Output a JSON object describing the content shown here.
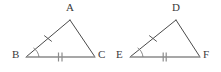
{
  "figure": {
    "background_color": "#ffffff",
    "stroke_color": "#4a4a4a",
    "base_stroke_color": "#8a8a8a",
    "label_color": "#3a3a3a",
    "triangles": [
      {
        "name": "triangle-abc",
        "vertices": [
          {
            "label": "A",
            "x": 70,
            "y": 20,
            "label_x": 66,
            "label_y": 2
          },
          {
            "label": "B",
            "x": 26,
            "y": 57,
            "label_x": 12,
            "label_y": 49
          },
          {
            "label": "C",
            "x": 95,
            "y": 57,
            "label_x": 98,
            "label_y": 49
          }
        ],
        "sides": [
          {
            "name": "side-ab",
            "from": "A",
            "to": "B",
            "ticks": 1
          },
          {
            "name": "side-ac",
            "from": "A",
            "to": "C",
            "ticks": 0
          },
          {
            "name": "side-bc",
            "from": "B",
            "to": "C",
            "ticks": 2
          }
        ],
        "angle_marks": [
          {
            "name": "angle-b",
            "at": "B",
            "arcs": 1
          }
        ]
      },
      {
        "name": "triangle-def",
        "vertices": [
          {
            "label": "D",
            "x": 176,
            "y": 20,
            "label_x": 172,
            "label_y": 2
          },
          {
            "label": "E",
            "x": 130,
            "y": 57,
            "label_x": 116,
            "label_y": 49
          },
          {
            "label": "F",
            "x": 200,
            "y": 57,
            "label_x": 203,
            "label_y": 49
          }
        ],
        "sides": [
          {
            "name": "side-de",
            "from": "D",
            "to": "E",
            "ticks": 1
          },
          {
            "name": "side-df",
            "from": "D",
            "to": "F",
            "ticks": 0
          },
          {
            "name": "side-ef",
            "from": "E",
            "to": "F",
            "ticks": 2
          }
        ],
        "angle_marks": [
          {
            "name": "angle-e",
            "at": "E",
            "arcs": 1
          }
        ]
      }
    ]
  },
  "labels": {
    "a": "A",
    "b": "B",
    "c": "C",
    "d": "D",
    "e": "E",
    "f": "F"
  }
}
